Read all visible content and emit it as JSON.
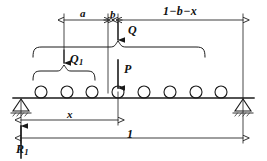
{
  "figure": {
    "stroke_color": "#1a1a1a",
    "background": "#ffffff"
  },
  "dimensions": {
    "a_label": "a",
    "b_label": "b",
    "right_span_label": "1−b−x",
    "x_label": "x",
    "length_label": "1"
  },
  "forces": {
    "Q_label": "Q",
    "Q1_label": "Q",
    "Q1_subscript": "1",
    "P_label": "P",
    "R1_label": "R",
    "R1_subscript": "1"
  },
  "beam": {
    "wheel_count": 8,
    "loaded_wheel_index": 4,
    "support_left": "pinned-triangle",
    "support_right": "pinned-triangle"
  }
}
